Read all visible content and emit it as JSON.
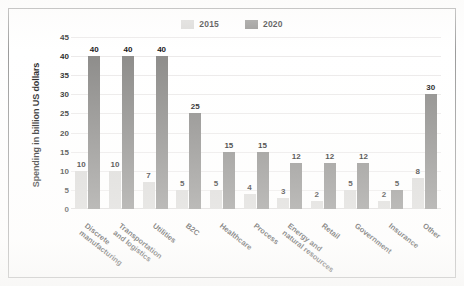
{
  "chart_data": {
    "type": "bar",
    "title": "",
    "xlabel": "",
    "ylabel": "Spending in billion US dollars",
    "ylim": [
      0,
      45
    ],
    "ytick_step": 5,
    "yticks": [
      45,
      40,
      35,
      30,
      25,
      20,
      15,
      10,
      5,
      0
    ],
    "grid": true,
    "legend_position": "top-center",
    "categories": [
      "Discrete\nmanufacturing",
      "Transportation\nand logistics",
      "Utilities",
      "B2C",
      "Healthcare",
      "Process",
      "Energy and\nnatural resources",
      "Retail",
      "Government",
      "Insurance",
      "Other"
    ],
    "series": [
      {
        "name": "2015",
        "color": "#d9d8d6",
        "values": [
          10,
          10,
          7,
          5,
          5,
          4,
          3,
          2,
          5,
          2,
          8
        ]
      },
      {
        "name": "2020",
        "color": "#8d8c8a",
        "values": [
          40,
          40,
          40,
          25,
          15,
          15,
          12,
          12,
          12,
          5,
          30
        ]
      }
    ]
  },
  "legend": {
    "items": [
      {
        "label": "2015",
        "color": "#d9d8d6"
      },
      {
        "label": "2020",
        "color": "#8d8c8a"
      }
    ]
  },
  "colors": {
    "series_2015": "#d9d8d6",
    "series_2020": "#8d8c8a",
    "frame_border": "#9b9b9b",
    "gridline": "#eceaea",
    "text": "#1f1f1f"
  }
}
